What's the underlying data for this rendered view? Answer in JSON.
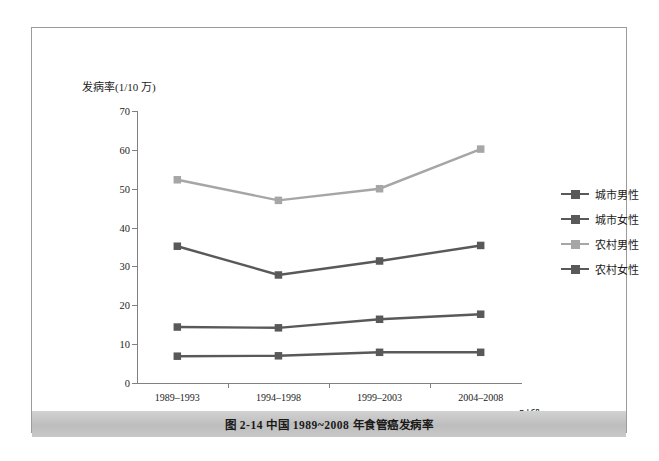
{
  "figure": {
    "caption": "图 2-14    中国 1989~2008 年食管癌发病率"
  },
  "chart_data": {
    "type": "line",
    "title": "",
    "xlabel": "时段",
    "ylabel": "发病率(1/10 万)",
    "categories": [
      "1989–1993",
      "1994–1998",
      "1999–2003",
      "2004–2008"
    ],
    "ylim": [
      0,
      70
    ],
    "yticks": [
      0,
      10,
      20,
      30,
      40,
      50,
      60,
      70
    ],
    "grid": false,
    "legend_position": "right",
    "series": [
      {
        "name": "城市男性",
        "values": [
          35.2,
          27.8,
          31.4,
          35.4
        ],
        "color": "#595959"
      },
      {
        "name": "城市女性",
        "values": [
          14.4,
          14.2,
          16.4,
          17.7
        ],
        "color": "#595959"
      },
      {
        "name": "农村男性",
        "values": [
          52.3,
          47.0,
          50.0,
          60.2
        ],
        "color": "#a6a6a6"
      },
      {
        "name": "农村女性",
        "values": [
          6.9,
          7.0,
          7.9,
          7.9
        ],
        "color": "#595959"
      }
    ]
  }
}
